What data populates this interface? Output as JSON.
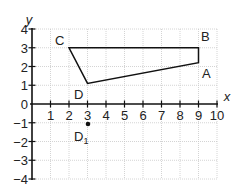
{
  "diagram": {
    "type": "coordinate-grid",
    "x_axis": {
      "label": "x",
      "min": 0,
      "max": 10,
      "ticks": [
        "1",
        "2",
        "3",
        "4",
        "5",
        "6",
        "7",
        "8",
        "9",
        "10"
      ]
    },
    "y_axis": {
      "label": "y",
      "min": -4,
      "max": 4,
      "ticks": [
        "4",
        "3",
        "2",
        "1",
        "0",
        "−1",
        "−2",
        "−3",
        "−4"
      ]
    },
    "shape": {
      "name": "quadrilateral ABCD",
      "vertices": [
        {
          "label": "A",
          "x": 9,
          "y": 2.2
        },
        {
          "label": "B",
          "x": 9,
          "y": 3
        },
        {
          "label": "C",
          "x": 2,
          "y": 3
        },
        {
          "label": "D",
          "x": 3,
          "y": 1.1
        }
      ]
    },
    "points": [
      {
        "label": "D",
        "sub": "1",
        "x": 3,
        "y": -1
      }
    ],
    "labels": {
      "A": "A",
      "B": "B",
      "C": "C",
      "D": "D",
      "D1_main": "D",
      "D1_sub": "1"
    },
    "colors": {
      "grid": "#c9c9c9",
      "ink": "#111111"
    }
  }
}
